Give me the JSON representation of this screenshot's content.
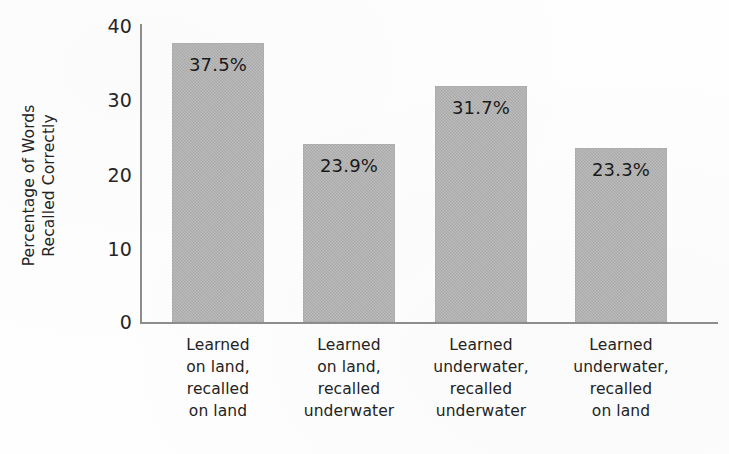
{
  "chart_data": {
    "type": "bar",
    "title": "",
    "subtitle": "",
    "xlabel": "",
    "ylabel": "Percentage of Words Recalled Correctly",
    "ylabel_lines": [
      "Percentage of Words",
      "Recalled Correctly"
    ],
    "ylim": [
      0,
      40
    ],
    "ytick_labels": [
      "40",
      "30",
      "20",
      "10",
      "0"
    ],
    "ytick_values": [
      40,
      30,
      20,
      10,
      0
    ],
    "grid": false,
    "legend": false,
    "legend_position": "none",
    "bar_color": "#aeaeae",
    "axis_color": "#8d8d8d",
    "text_color": "#232323",
    "categories": [
      "Learned on land, recalled on land",
      "Learned on land, recalled underwater",
      "Learned underwater, recalled underwater",
      "Learned underwater, recalled on land"
    ],
    "category_lines": [
      [
        "Learned",
        "on land,",
        "recalled",
        "on land"
      ],
      [
        "Learned",
        "on land,",
        "recalled",
        "underwater"
      ],
      [
        "Learned",
        "underwater,",
        "recalled",
        "underwater"
      ],
      [
        "Learned",
        "underwater,",
        "recalled",
        "on land"
      ]
    ],
    "values": [
      37.5,
      23.9,
      31.7,
      23.3
    ],
    "value_labels": [
      "37.5%",
      "23.9%",
      "31.7%",
      "23.3%"
    ]
  }
}
